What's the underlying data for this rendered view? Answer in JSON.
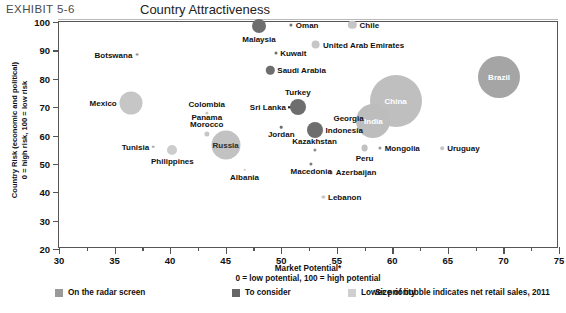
{
  "header": {
    "exhibit_id": "EXHIBIT 5-6",
    "title": "Country Attractiveness"
  },
  "legend": {
    "items": [
      {
        "label": "On the radar screen",
        "color": "#9a9a9a"
      },
      {
        "label": "To consider",
        "color": "#676767"
      },
      {
        "label": "Lower priority",
        "color": "#cfcfcf"
      }
    ],
    "note": "Size of bubble indicates net retail sales, 2011"
  },
  "chart_data": {
    "type": "scatter",
    "title": "Country Attractiveness",
    "xlabel": "Market Potential*",
    "xlabel_sub": "0 = low potential, 100 = high potential",
    "ylabel": "Country Risk (economic and political)",
    "ylabel_sub": "0 = high risk, 100 = low risk",
    "xlim": [
      30,
      75
    ],
    "ylim": [
      20,
      100
    ],
    "xticks": [
      30,
      35,
      40,
      45,
      50,
      55,
      60,
      65,
      70,
      75
    ],
    "yticks": [
      20,
      30,
      40,
      50,
      60,
      70,
      80,
      90,
      100
    ],
    "grid": false,
    "legend_position": "below",
    "size_encodes": "net retail sales, 2011",
    "categories": {
      "radar": "On the radar screen",
      "consider": "To consider",
      "lower": "Lower priority"
    },
    "points": [
      {
        "name": "Malaysia",
        "x": 48.0,
        "y": 98.5,
        "r": 7.0,
        "group": "consider",
        "label_pos": "below",
        "color": "#6e6e6e"
      },
      {
        "name": "Oman",
        "x": 50.9,
        "y": 99.0,
        "r": 1.6,
        "group": "consider",
        "label_pos": "right",
        "color": "#6e6e6e"
      },
      {
        "name": "Chile",
        "x": 56.4,
        "y": 99.0,
        "r": 4.2,
        "group": "lower",
        "label_pos": "right",
        "color": "#c6c6c6"
      },
      {
        "name": "United Arab Emirates",
        "x": 53.1,
        "y": 92.0,
        "r": 4.4,
        "group": "lower",
        "label_pos": "right",
        "color": "#c6c6c6"
      },
      {
        "name": "Kuwait",
        "x": 49.5,
        "y": 89.0,
        "r": 1.5,
        "group": "consider",
        "label_pos": "right",
        "color": "#6e6e6e"
      },
      {
        "name": "Botswana",
        "x": 37.0,
        "y": 88.5,
        "r": 1.4,
        "group": "radar",
        "label_pos": "left",
        "color": "#8d8d8d"
      },
      {
        "name": "Saudi Arabia",
        "x": 49.0,
        "y": 83.0,
        "r": 4.2,
        "group": "consider",
        "label_pos": "right",
        "color": "#6e6e6e"
      },
      {
        "name": "Brazil",
        "x": 69.6,
        "y": 80.5,
        "r": 21.0,
        "group": "radar",
        "label_pos": "inside",
        "color": "#a5a5a5"
      },
      {
        "name": "China",
        "x": 60.3,
        "y": 72.0,
        "r": 26.0,
        "group": "lower",
        "label_pos": "inside",
        "color": "#bfbfbf"
      },
      {
        "name": "Turkey",
        "x": 51.5,
        "y": 70.0,
        "r": 8.0,
        "group": "consider",
        "label_pos": "above",
        "color": "#6e6e6e"
      },
      {
        "name": "Mexico",
        "x": 36.5,
        "y": 71.5,
        "r": 11.5,
        "group": "lower",
        "label_pos": "left",
        "color": "#c6c6c6"
      },
      {
        "name": "Colombia",
        "x": 43.3,
        "y": 68.0,
        "r": 1.6,
        "group": "lower",
        "label_pos": "above",
        "color": "#c6c6c6"
      },
      {
        "name": "Sri Lanka",
        "x": 50.6,
        "y": 70.0,
        "r": 0.0,
        "group": "consider",
        "label_pos": "leader",
        "color": "#6e6e6e"
      },
      {
        "name": "Georgia",
        "x": 57.6,
        "y": 66.0,
        "r": 0.0,
        "group": "lower",
        "label_pos": "leader",
        "color": "#bfbfbf"
      },
      {
        "name": "India",
        "x": 58.3,
        "y": 65.0,
        "r": 17.0,
        "group": "lower",
        "label_pos": "inside",
        "color": "#bdbdbd"
      },
      {
        "name": "Panama",
        "x": 43.3,
        "y": 63.5,
        "r": 1.3,
        "group": "lower",
        "label_pos": "above",
        "color": "#c6c6c6"
      },
      {
        "name": "Morocco",
        "x": 43.3,
        "y": 60.5,
        "r": 2.6,
        "group": "lower",
        "label_pos": "above",
        "color": "#c6c6c6"
      },
      {
        "name": "Jordan",
        "x": 50.0,
        "y": 63.0,
        "r": 1.3,
        "group": "consider",
        "label_pos": "below",
        "color": "#6e6e6e"
      },
      {
        "name": "Indonesia",
        "x": 53.0,
        "y": 62.0,
        "r": 8.0,
        "group": "consider",
        "label_pos": "right",
        "color": "#6e6e6e"
      },
      {
        "name": "Tunisia",
        "x": 38.5,
        "y": 56.0,
        "r": 1.3,
        "group": "radar",
        "label_pos": "left",
        "color": "#a8a8a8"
      },
      {
        "name": "Russia",
        "x": 45.0,
        "y": 56.5,
        "r": 14.5,
        "group": "radar",
        "label_pos": "inside-dark",
        "color": "#c2c2c2"
      },
      {
        "name": "Philippines",
        "x": 40.2,
        "y": 55.0,
        "r": 5.0,
        "group": "lower",
        "label_pos": "below",
        "color": "#cdcdcd"
      },
      {
        "name": "Kazakhstan",
        "x": 53.0,
        "y": 55.0,
        "r": 1.6,
        "group": "radar",
        "label_pos": "above",
        "color": "#8d8d8d"
      },
      {
        "name": "Peru",
        "x": 57.5,
        "y": 55.5,
        "r": 3.4,
        "group": "lower",
        "label_pos": "below",
        "color": "#c1c1c1"
      },
      {
        "name": "Mongolia",
        "x": 58.9,
        "y": 55.5,
        "r": 1.6,
        "group": "lower",
        "label_pos": "right",
        "color": "#9a9a9a"
      },
      {
        "name": "Uruguay",
        "x": 64.5,
        "y": 55.5,
        "r": 1.8,
        "group": "lower",
        "label_pos": "right",
        "color": "#c6c6c6"
      },
      {
        "name": "Albania",
        "x": 46.7,
        "y": 48.0,
        "r": 1.2,
        "group": "lower",
        "label_pos": "below",
        "color": "#c6c6c6"
      },
      {
        "name": "Macedonia",
        "x": 52.7,
        "y": 50.0,
        "r": 1.6,
        "group": "radar",
        "label_pos": "below",
        "color": "#7c7c7c"
      },
      {
        "name": "Azerbaijan",
        "x": 54.5,
        "y": 47.0,
        "r": 1.6,
        "group": "radar",
        "label_pos": "right",
        "color": "#9a9a9a"
      },
      {
        "name": "Lebanon",
        "x": 53.8,
        "y": 38.5,
        "r": 1.6,
        "group": "lower",
        "label_pos": "right",
        "color": "#c6c6c6"
      }
    ],
    "annotations": [
      {
        "type": "leader",
        "from": "Sri Lanka",
        "to": "Turkey"
      },
      {
        "type": "leader",
        "from": "Georgia",
        "to": "India"
      }
    ]
  }
}
